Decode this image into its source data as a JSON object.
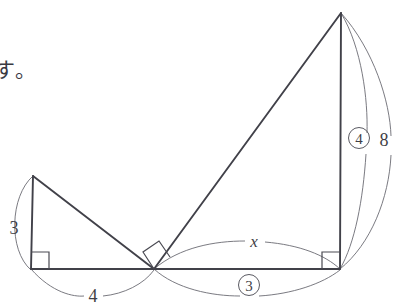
{
  "page": {
    "background_color": "#ffffff",
    "stroke_color": "#4a4a52",
    "text_color": "#3f3f46"
  },
  "text_fragment": {
    "content": "す。",
    "note": "partial Japanese sentence ending, cut off at left edge"
  },
  "figure": {
    "type": "geometry-diagram",
    "vertices": {
      "left_apex": {
        "x": 33,
        "y": 176
      },
      "left_base": {
        "x": 31,
        "y": 269
      },
      "middle_base": {
        "x": 154,
        "y": 269
      },
      "right_base": {
        "x": 340,
        "y": 269
      },
      "right_apex": {
        "x": 341,
        "y": 13
      }
    },
    "right_angle_marks": [
      {
        "name": "left-triangle-right-angle",
        "at": "left_base",
        "rotation": 0
      },
      {
        "name": "middle-right-angle",
        "at": "middle_base",
        "rotation": 38
      },
      {
        "name": "right-triangle-right-angle",
        "at": "right_base",
        "rotation": 0
      }
    ],
    "labels": [
      {
        "id": "label-3-left",
        "text": "3",
        "kind": "plain",
        "x": 14,
        "y": 228,
        "measures": "left triangle vertical leg"
      },
      {
        "id": "label-4-bottom",
        "text": "4",
        "kind": "plain",
        "x": 92,
        "y": 295,
        "measures": "left triangle horizontal leg"
      },
      {
        "id": "label-x",
        "text": "x",
        "kind": "italic",
        "x": 254,
        "y": 246,
        "measures": "right triangle horizontal leg (unknown)"
      },
      {
        "id": "label-3-circled",
        "text": "3",
        "kind": "circled",
        "x": 249,
        "y": 290,
        "measures": "right triangle horizontal leg ratio part"
      },
      {
        "id": "label-4-circled",
        "text": "4",
        "kind": "circled",
        "x": 359,
        "y": 143,
        "measures": "right triangle vertical leg ratio part"
      },
      {
        "id": "label-8",
        "text": "8",
        "kind": "plain",
        "x": 383,
        "y": 146,
        "measures": "right triangle vertical leg length"
      }
    ],
    "arcs": [
      {
        "id": "arc-3-left",
        "label": "3",
        "from": "left_apex",
        "to": "left_base",
        "bulge": "left"
      },
      {
        "id": "arc-4-bottom",
        "label": "4",
        "from": "left_base",
        "to": "middle_base",
        "bulge": "down"
      },
      {
        "id": "arc-x",
        "label": "x",
        "from": "middle_base",
        "to": "right_base",
        "bulge": "up"
      },
      {
        "id": "arc-3-circled",
        "label": "3",
        "from": "middle_base",
        "to": "right_base",
        "bulge": "down"
      },
      {
        "id": "arc-4-circled",
        "label": "4",
        "from": "right_apex",
        "to": "right_base",
        "bulge": "right-inner"
      },
      {
        "id": "arc-8",
        "label": "8",
        "from": "right_apex",
        "to": "right_base",
        "bulge": "right-outer"
      }
    ]
  }
}
